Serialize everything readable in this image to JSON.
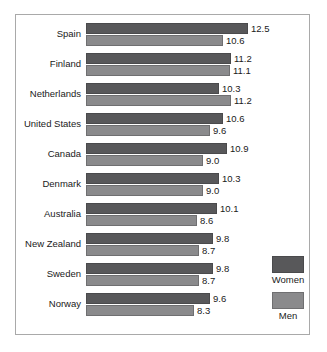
{
  "chart_data": {
    "type": "bar",
    "orientation": "horizontal",
    "title": "",
    "subtitle": "",
    "xlabel": "",
    "ylabel": "",
    "grid": false,
    "xlim": [
      0,
      12.5
    ],
    "legend_position": "bottom-right",
    "categories": [
      "Spain",
      "Finland",
      "Netherlands",
      "United States",
      "Canada",
      "Denmark",
      "Australia",
      "New Zealand",
      "Sweden",
      "Norway"
    ],
    "series": [
      {
        "name": "Women",
        "color": "#58585a",
        "values": [
          12.5,
          11.2,
          10.3,
          10.6,
          10.9,
          10.3,
          10.1,
          9.8,
          9.8,
          9.6
        ],
        "value_labels": [
          "12.5",
          "11.2",
          "10.3",
          "10.6",
          "10.9",
          "10.3",
          "10.1",
          "9.8",
          "9.8",
          "9.6"
        ]
      },
      {
        "name": "Men",
        "color": "#8a8a8c",
        "values": [
          10.6,
          11.1,
          11.2,
          9.6,
          9.0,
          9.0,
          8.6,
          8.7,
          8.7,
          8.3
        ],
        "value_labels": [
          "10.6",
          "11.1",
          "11.2",
          "9.6",
          "9.0",
          "9.0",
          "8.6",
          "8.7",
          "8.7",
          "8.3"
        ]
      }
    ]
  },
  "legend": {
    "entries": [
      {
        "label": "Women",
        "color": "#58585a"
      },
      {
        "label": "Men",
        "color": "#8a8a8c"
      }
    ]
  }
}
